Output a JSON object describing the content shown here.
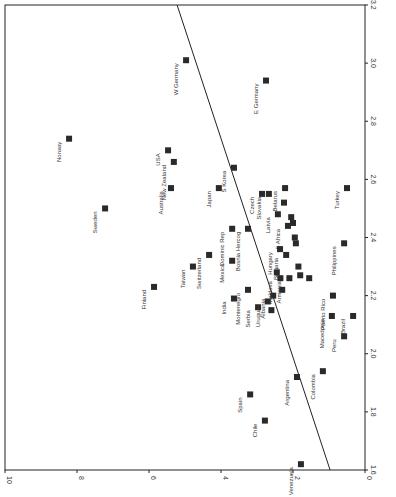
{
  "chart_data": {
    "type": "scatter",
    "orientation_note": "figure rendered rotated 90 degrees clockwise",
    "title": "",
    "xlabel": "",
    "ylabel": "",
    "x_axis": {
      "position": "bottom (rotated)",
      "range": [
        10,
        0
      ],
      "ticks": [
        10,
        8,
        6,
        4,
        2,
        0
      ]
    },
    "y_axis": {
      "position": "right (rotated)",
      "range": [
        1.6,
        3.2
      ],
      "ticks": [
        1.6,
        1.8,
        2.0,
        2.2,
        2.4,
        2.6,
        2.8,
        3.0,
        3.2
      ]
    },
    "grid": false,
    "legend": null,
    "fit_line": {
      "start": {
        "x": 0.97,
        "y": 1.6
      },
      "end": {
        "x": 5.22,
        "y": 3.2
      }
    },
    "points": [
      {
        "label": "W Germany",
        "x": 4.97,
        "y": 3.01
      },
      {
        "label": "E Germany",
        "x": 2.75,
        "y": 2.94
      },
      {
        "label": "Norway",
        "x": 8.22,
        "y": 2.74
      },
      {
        "label": "USA",
        "x": 5.47,
        "y": 2.7
      },
      {
        "label": "New Zealand",
        "x": 5.31,
        "y": 2.66
      },
      {
        "label": "Australia",
        "x": 5.39,
        "y": 2.57
      },
      {
        "label": "Sweden",
        "x": 7.22,
        "y": 2.5
      },
      {
        "label": "S Korea",
        "x": 3.64,
        "y": 2.64
      },
      {
        "label": "Japan",
        "x": 4.06,
        "y": 2.57
      },
      {
        "label": "Turkey",
        "x": 0.5,
        "y": 2.57
      },
      {
        "label": "Czech",
        "x": 2.86,
        "y": 2.55
      },
      {
        "label": "Slovakia",
        "x": 2.67,
        "y": 2.55
      },
      {
        "label": "Belarus",
        "x": 2.22,
        "y": 2.57
      },
      {
        "label": "Latvia",
        "x": 2.42,
        "y": 2.48
      },
      {
        "label": "S Africa",
        "x": 2.14,
        "y": 2.44
      },
      {
        "label": "Philippines",
        "x": 0.58,
        "y": 2.38
      },
      {
        "label": "Dominic Rep",
        "x": 3.69,
        "y": 2.43
      },
      {
        "label": "Bosnia Hercog",
        "x": 3.25,
        "y": 2.43
      },
      {
        "label": "Hungary",
        "x": 2.36,
        "y": 2.36
      },
      {
        "label": "Bulgaria",
        "x": 2.19,
        "y": 2.34
      },
      {
        "label": "Mexico",
        "x": 3.69,
        "y": 2.32
      },
      {
        "label": "Switzerland",
        "x": 4.33,
        "y": 2.34
      },
      {
        "label": "Taiwan",
        "x": 4.78,
        "y": 2.3
      },
      {
        "label": "Finland",
        "x": 5.86,
        "y": 2.23
      },
      {
        "label": "India",
        "x": 3.64,
        "y": 2.19
      },
      {
        "label": "Montenegro",
        "x": 3.25,
        "y": 2.22
      },
      {
        "label": "Serbia",
        "x": 2.97,
        "y": 2.16
      },
      {
        "label": "Uruguay",
        "x": 2.7,
        "y": 2.18
      },
      {
        "label": "Albania",
        "x": 2.55,
        "y": 2.2
      },
      {
        "label": "Moldova",
        "x": 2.35,
        "y": 2.26
      },
      {
        "label": "Armenia",
        "x": 2.1,
        "y": 2.26
      },
      {
        "label": "Puerto Rico",
        "x": 0.89,
        "y": 2.2
      },
      {
        "label": "Macedonia",
        "x": 0.92,
        "y": 2.13
      },
      {
        "label": "Brazil",
        "x": 0.33,
        "y": 2.13
      },
      {
        "label": "Peru",
        "x": 0.58,
        "y": 2.06
      },
      {
        "label": "Colombia",
        "x": 1.17,
        "y": 1.94
      },
      {
        "label": "Argentina",
        "x": 1.89,
        "y": 1.92
      },
      {
        "label": "Spain",
        "x": 3.19,
        "y": 1.86
      },
      {
        "label": "Chile",
        "x": 2.78,
        "y": 1.77
      },
      {
        "label": "Venezuela",
        "x": 1.78,
        "y": 1.62
      }
    ],
    "unlabeled_points": [
      {
        "x": 2.25,
        "y": 2.52
      },
      {
        "x": 2.05,
        "y": 2.47
      },
      {
        "x": 2.0,
        "y": 2.45
      },
      {
        "x": 1.95,
        "y": 2.4
      },
      {
        "x": 1.92,
        "y": 2.38
      },
      {
        "x": 1.85,
        "y": 2.3
      },
      {
        "x": 1.8,
        "y": 2.27
      },
      {
        "x": 1.55,
        "y": 2.26
      },
      {
        "x": 2.45,
        "y": 2.28
      },
      {
        "x": 2.6,
        "y": 2.15
      },
      {
        "x": 2.3,
        "y": 2.22
      }
    ]
  },
  "axis_labels": {
    "bottom": [
      "10",
      "8",
      "6",
      "4",
      "2",
      "0"
    ],
    "right": [
      "1.6",
      "1.8",
      "2.0",
      "2.2",
      "2.4",
      "2.6",
      "2.8",
      "3.0",
      "3.2"
    ]
  }
}
